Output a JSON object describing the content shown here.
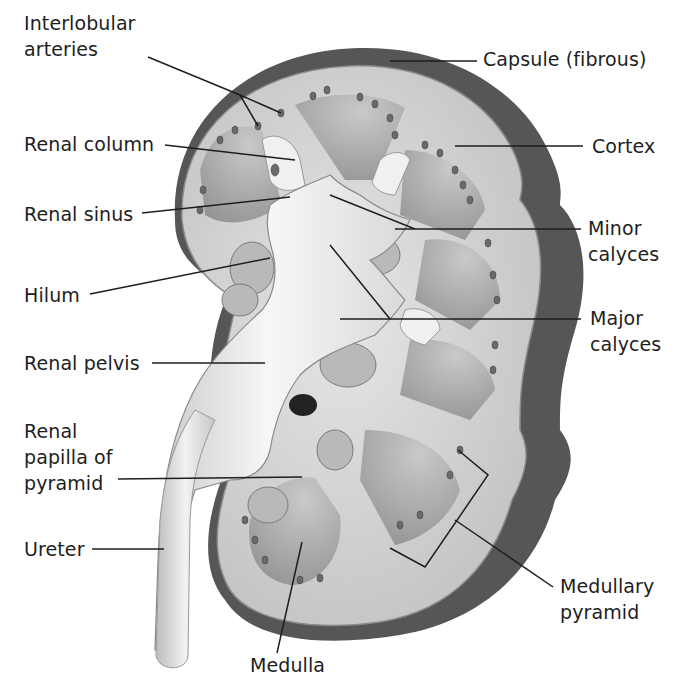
{
  "diagram": {
    "colors": {
      "background": "#ffffff",
      "capsule": "#5a5a5a",
      "cortex": "#d4d4d4",
      "medulla": "#9a9a9a",
      "pelvis": "#ececec",
      "sinus_fat": "#bdbdbd",
      "leader_line": "#1e1e1e",
      "label_text": "#1e1e1e"
    },
    "labels": {
      "interlobular_arteries": "Interlobular\narteries",
      "renal_column": "Renal column",
      "renal_sinus": "Renal sinus",
      "hilum": "Hilum",
      "renal_pelvis": "Renal pelvis",
      "renal_papilla": "Renal\npapilla of\npyramid",
      "ureter": "Ureter",
      "medulla": "Medulla",
      "capsule": "Capsule (fibrous)",
      "cortex": "Cortex",
      "minor_calyces": "Minor\ncalyces",
      "major_calyces": "Major\ncalyces",
      "medullary_pyramid": "Medullary\npyramid"
    }
  }
}
